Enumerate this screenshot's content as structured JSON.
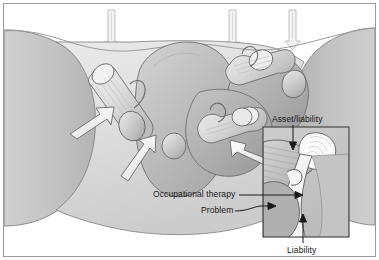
{
  "figure": {
    "kind": "grayscale-anatomical-concept-illustration",
    "frame": {
      "border_color": "#9a9a9a",
      "background": "#ffffff"
    },
    "palette": {
      "paper": "#ffffff",
      "light_tissue": "#e6e6e6",
      "mid_tissue": "#c9c9c9",
      "dark_tissue": "#a8a8a8",
      "darker_tissue": "#949494",
      "outline": "#3a3a3a",
      "arrow_fill": "#f7f7f7",
      "arrow_stroke": "#555555",
      "label_text": "#151515",
      "inset_border": "#4a4a4a",
      "leader_line": "#1a1a1a",
      "load_arrow": "#d8d8d8"
    },
    "labels": [
      {
        "id": "asset",
        "text": "Asset/liability",
        "x": 268,
        "y": 110
      },
      {
        "id": "occupational",
        "text": "Occupational therapy",
        "x": 149,
        "y": 185
      },
      {
        "id": "problem",
        "text": "Problem",
        "x": 197,
        "y": 201
      },
      {
        "id": "liability",
        "text": "Liability",
        "x": 283,
        "y": 241
      }
    ],
    "load_arrows": {
      "count": 3,
      "direction": "down",
      "description": "three vertical downward load arrows entering the top surface",
      "x_positions": [
        110,
        231,
        291
      ]
    },
    "force_arrows": {
      "count": 3,
      "description": "three white block arrows indicating directed force into the structure",
      "directions": [
        "up-right",
        "up-right",
        "left"
      ]
    },
    "inset": {
      "description": "magnified detail box, lower right",
      "x": 262,
      "y": 126,
      "width": 86,
      "height": 110,
      "border_color": "#4a4a4a"
    }
  }
}
